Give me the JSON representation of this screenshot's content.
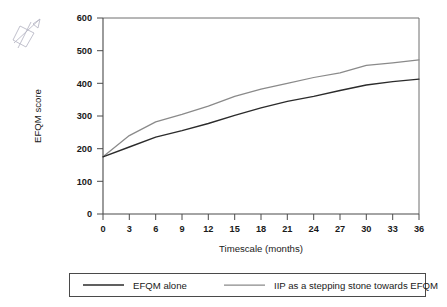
{
  "chart_data": {
    "type": "line",
    "title": "",
    "xlabel": "Timescale (months)",
    "ylabel": "EFQM score",
    "xlim": [
      0,
      36
    ],
    "ylim": [
      0,
      600
    ],
    "xticks": [
      0,
      3,
      6,
      9,
      12,
      15,
      18,
      21,
      24,
      27,
      30,
      33,
      36
    ],
    "yticks": [
      0,
      100,
      200,
      300,
      400,
      500,
      600
    ],
    "xtick_labels": [
      "0",
      "3",
      "6",
      "9",
      "12",
      "15",
      "18",
      "21",
      "24",
      "27",
      "30",
      "33",
      "36"
    ],
    "ytick_labels": [
      "0",
      "100",
      "200",
      "300",
      "400",
      "500",
      "600"
    ],
    "grid": false,
    "legend_position": "bottom",
    "x": [
      0,
      3,
      6,
      9,
      12,
      15,
      18,
      21,
      24,
      27,
      30,
      33,
      36
    ],
    "series": [
      {
        "name": "EFQM alone",
        "color": "#2b2b2b",
        "values": [
          175,
          205,
          235,
          255,
          277,
          302,
          325,
          345,
          360,
          378,
          395,
          405,
          413
        ]
      },
      {
        "name": "IIP as a stepping stone towards EFQM",
        "color": "#8a8a8a",
        "values": [
          175,
          240,
          282,
          305,
          330,
          360,
          382,
          400,
          418,
          432,
          455,
          463,
          472
        ]
      }
    ]
  },
  "legend": {
    "entries": [
      {
        "label": "EFQM alone"
      },
      {
        "label": "IIP as a stepping stone towards EFQM"
      }
    ]
  },
  "annotations": {
    "scribble": "handwritten-mark"
  }
}
